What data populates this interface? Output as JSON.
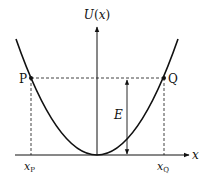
{
  "diagram": {
    "y_axis_label": "U(x)",
    "y_axis_label_func": "U",
    "y_axis_label_arg": "x",
    "x_axis_label": "x",
    "energy_label": "E",
    "point_left": {
      "label": "P",
      "x_label_main": "x",
      "x_label_sub": "P"
    },
    "point_right": {
      "label": "Q",
      "x_label_main": "x",
      "x_label_sub": "Q"
    },
    "curve": "parabola U(x) with minimum at origin",
    "colors": {
      "stroke": "#111111",
      "background": "#ffffff"
    }
  }
}
